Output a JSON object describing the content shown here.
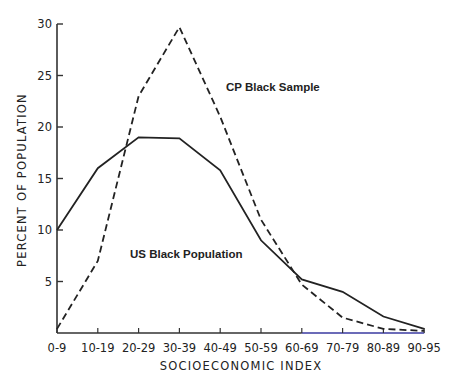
{
  "chart_data": {
    "type": "line",
    "title": "",
    "xlabel": "SOCIOECONOMIC INDEX",
    "ylabel": "PERCENT OF POPULATION",
    "categories": [
      "0-9",
      "10-19",
      "20-29",
      "30-39",
      "40-49",
      "50-59",
      "60-69",
      "70-79",
      "80-89",
      "90-95"
    ],
    "yticks": [
      5,
      10,
      15,
      20,
      25,
      30
    ],
    "ylim": [
      0,
      30
    ],
    "grid": false,
    "legend": "inline annotations",
    "series": [
      {
        "name": "US Black Population",
        "style": "solid",
        "values": [
          10,
          16,
          19,
          18.9,
          15.8,
          9,
          5.2,
          4,
          1.6,
          0.4
        ]
      },
      {
        "name": "CP Black Sample",
        "style": "dashed",
        "values": [
          0.4,
          7,
          23,
          29.7,
          21,
          11,
          4.7,
          1.5,
          0.4,
          0.2
        ]
      }
    ],
    "annotations": [
      {
        "text": "CP Black Sample",
        "series": "CP Black Sample"
      },
      {
        "text": "US Black Population",
        "series": "US Black Population"
      }
    ]
  },
  "colors": {
    "line": "#222222",
    "axis": "#333333",
    "baseline_right": "#3a3aa0"
  }
}
